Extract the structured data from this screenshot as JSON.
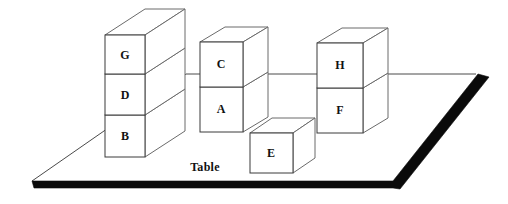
{
  "scene": {
    "title": "Blocks World Table Scene",
    "surface_label": "Table",
    "width": 508,
    "height": 204,
    "background_color": "#ffffff",
    "line_color": "#3a3a3a",
    "edge_color": "#0a0a0a"
  },
  "blocks": {
    "g": {
      "label": "G"
    },
    "d": {
      "label": "D"
    },
    "b": {
      "label": "B"
    },
    "c": {
      "label": "C"
    },
    "a": {
      "label": "A"
    },
    "h": {
      "label": "H"
    },
    "f": {
      "label": "F"
    },
    "e": {
      "label": "E"
    }
  },
  "stacks": [
    {
      "name": "left-stack",
      "blocks": [
        "G",
        "D",
        "B"
      ]
    },
    {
      "name": "middle-stack",
      "blocks": [
        "C",
        "A"
      ]
    },
    {
      "name": "right-stack",
      "blocks": [
        "H",
        "F"
      ]
    },
    {
      "name": "lone-block",
      "blocks": [
        "E"
      ]
    }
  ]
}
